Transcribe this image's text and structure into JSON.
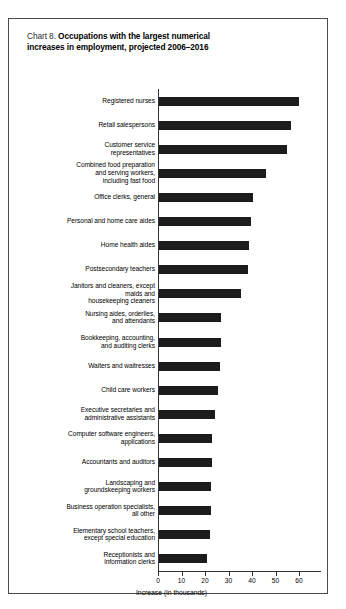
{
  "chart_data": {
    "type": "bar",
    "orientation": "horizontal",
    "title_prefix": "Chart 8.",
    "title": "Occupations with the largest numerical increases in employment, projected 2006–2016",
    "title_line1": "Occupations with the largest numerical",
    "title_line2": "increases in employment, projected 2006–2016",
    "xlabel": "Increase (in thousands)",
    "ylabel": "",
    "xlim": [
      0,
      60
    ],
    "xticks": [
      0,
      10,
      20,
      30,
      40,
      50,
      60
    ],
    "xtick_labels": [
      "0",
      "10",
      "20",
      "30",
      "40",
      "50",
      "60"
    ],
    "grid": false,
    "legend": false,
    "bar_color": "#1c1c1c",
    "categories": [
      "Registered nurses",
      "Retail salespersons",
      "Customer service representatives",
      "Combined food preparation and serving workers, including fast food",
      "Office clerks, general",
      "Personal and home care aides",
      "Home health aides",
      "Postsecondary teachers",
      "Janitors and cleaners, except maids and housekeeping cleaners",
      "Nursing aides, orderlies, and attendants",
      "Bookkeeping, accounting, and auditing clerks",
      "Waiters and waitresses",
      "Child care workers",
      "Executive secretaries and administrative assistants",
      "Computer software engineers, applications",
      "Accountants and auditors",
      "Landscaping and groundskeeping workers",
      "Business operation specialists, all other",
      "Elementary school teachers, except special education",
      "Receptionists and information clerks"
    ],
    "category_lines": [
      [
        "Registered nurses"
      ],
      [
        "Retail salespersons"
      ],
      [
        "Customer service",
        "representatives"
      ],
      [
        "Combined food preparation",
        "and serving workers,",
        "including fast food"
      ],
      [
        "Office clerks, general"
      ],
      [
        "Personal and home care aides"
      ],
      [
        "Home health aides"
      ],
      [
        "Postsecondary teachers"
      ],
      [
        "Janitors and cleaners, except",
        "maids and",
        "housekeeping cleaners"
      ],
      [
        "Nursing aides, orderlies,",
        "and attendants"
      ],
      [
        "Bookkeeping, accounting,",
        "and auditing clerks"
      ],
      [
        "Waiters and waitresses"
      ],
      [
        "Child care workers"
      ],
      [
        "Executive secretaries and",
        "administrative assistants"
      ],
      [
        "Computer software engineers,",
        "applications"
      ],
      [
        "Accountants and auditors"
      ],
      [
        "Landscaping and",
        "groundskeeping workers"
      ],
      [
        "Business operation specialists,",
        "all other"
      ],
      [
        "Elementary school teachers,",
        "except special education"
      ],
      [
        "Receptionists and",
        "information clerks"
      ]
    ],
    "values": [
      59.5,
      56.0,
      54.5,
      45.5,
      40.0,
      39.0,
      38.5,
      38.0,
      35.0,
      26.5,
      26.5,
      26.0,
      25.0,
      24.0,
      22.5,
      22.5,
      22.0,
      22.0,
      21.5,
      20.5
    ]
  }
}
